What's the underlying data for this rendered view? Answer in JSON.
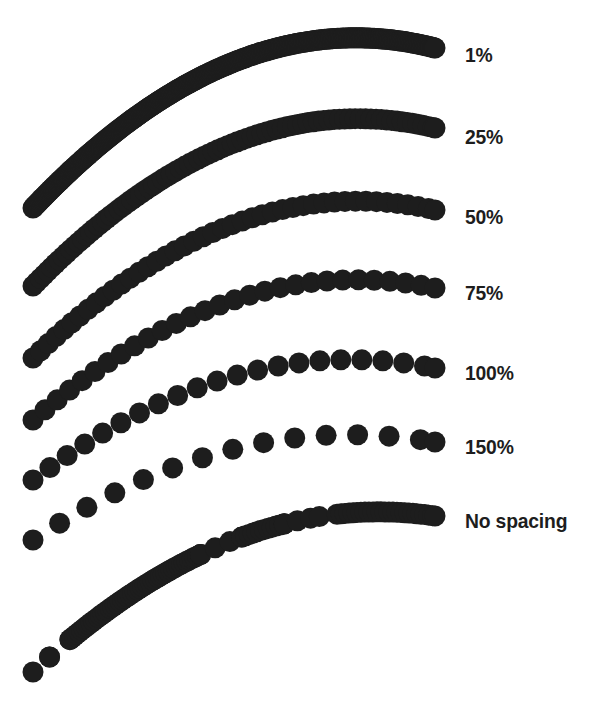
{
  "figure": {
    "background_color": "#ffffff",
    "ink_color": "#1d1d1d",
    "width": 599,
    "height": 708
  },
  "labels": {
    "row_1": "1%",
    "row_2": "25%",
    "row_3": "50%",
    "row_4": "75%",
    "row_5": "100%",
    "row_6": "150%",
    "row_7": "No spacing"
  },
  "chart_data": {
    "type": "line",
    "subtitle": "",
    "xlabel": "",
    "ylabel": "",
    "grid": false,
    "legend_position": "right",
    "legend_entries": [
      "1%",
      "25%",
      "50%",
      "75%",
      "100%",
      "150%",
      "No spacing"
    ],
    "dot_diameter_px": 21,
    "ink_color": "#1d1d1d",
    "x_start_px": 33,
    "x_end_px": 435,
    "label_x_px": 465,
    "series": [
      {
        "name": "1%",
        "spacing_percent": 1,
        "spacing_px": 0.21,
        "label_y_px": 55,
        "y_left_px": 208,
        "y_right_px": 48,
        "curve_bow_px": 66,
        "appearance": "solid",
        "irregular": false
      },
      {
        "name": "25%",
        "spacing_percent": 25,
        "spacing_px": 5.25,
        "label_y_px": 137,
        "y_left_px": 286,
        "y_right_px": 128,
        "curve_bow_px": 64,
        "appearance": "solid",
        "irregular": false
      },
      {
        "name": "50%",
        "spacing_percent": 50,
        "spacing_px": 10.5,
        "label_y_px": 217,
        "y_left_px": 358,
        "y_right_px": 210,
        "curve_bow_px": 60,
        "appearance": "slightly-bumpy",
        "irregular": false
      },
      {
        "name": "75%",
        "spacing_percent": 75,
        "spacing_px": 15.75,
        "label_y_px": 293,
        "y_left_px": 420,
        "y_right_px": 288,
        "curve_bow_px": 54,
        "appearance": "scalloped",
        "irregular": false
      },
      {
        "name": "100%",
        "spacing_percent": 100,
        "spacing_px": 21,
        "label_y_px": 373,
        "y_left_px": 480,
        "y_right_px": 368,
        "curve_bow_px": 48,
        "appearance": "dots-touching",
        "irregular": false
      },
      {
        "name": "150%",
        "spacing_percent": 150,
        "spacing_px": 31.5,
        "label_y_px": 447,
        "y_left_px": 540,
        "y_right_px": 442,
        "curve_bow_px": 42,
        "appearance": "separated-dots",
        "irregular": false
      },
      {
        "name": "No spacing",
        "spacing_percent": null,
        "spacing_px": 0,
        "label_y_px": 521,
        "y_left_px": 672,
        "y_right_px": 516,
        "curve_bow_px": 54,
        "appearance": "irregular-clumped",
        "irregular": true,
        "irregular_segments": [
          {
            "from_t": 0.0,
            "to_t": 0.05,
            "spacing_px": 30
          },
          {
            "from_t": 0.05,
            "to_t": 0.11,
            "spacing_px": 30
          },
          {
            "from_t": 0.11,
            "to_t": 0.46,
            "spacing_px": 3
          },
          {
            "from_t": 0.46,
            "to_t": 0.56,
            "spacing_px": 16
          },
          {
            "from_t": 0.56,
            "to_t": 0.66,
            "spacing_px": 4
          },
          {
            "from_t": 0.66,
            "to_t": 0.69,
            "spacing_px": 30
          },
          {
            "from_t": 0.72,
            "to_t": 0.74,
            "spacing_px": 40
          },
          {
            "from_t": 0.78,
            "to_t": 1.0,
            "spacing_px": 4
          }
        ]
      }
    ]
  }
}
